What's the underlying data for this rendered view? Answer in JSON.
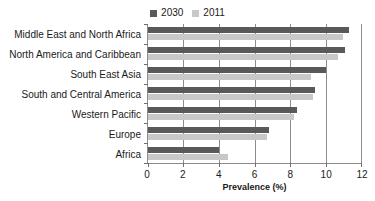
{
  "chart_data": {
    "type": "bar",
    "orientation": "horizontal",
    "title": "",
    "xlabel": "Prevalence (%)",
    "ylabel": "",
    "xlim": [
      0,
      12
    ],
    "xticks": [
      0,
      2,
      4,
      6,
      8,
      10,
      12
    ],
    "grid": true,
    "legend_position": "top-center",
    "categories": [
      "Middle East and North Africa",
      "North America and Caribbean",
      "South East Asia",
      "South and Central America",
      "Western Pacific",
      "Europe",
      "Africa"
    ],
    "series": [
      {
        "name": "2030",
        "color": "#595959",
        "values": [
          11.3,
          11.1,
          10.0,
          9.4,
          8.4,
          6.8,
          4.0
        ]
      },
      {
        "name": "2011",
        "color": "#c8c8c8",
        "values": [
          11.0,
          10.7,
          9.2,
          9.3,
          8.2,
          6.7,
          4.5
        ]
      }
    ]
  },
  "legend": {
    "entries": [
      {
        "label": "2030",
        "color": "#595959",
        "swatch_icon": "square-icon"
      },
      {
        "label": "2011",
        "color": "#c8c8c8",
        "swatch_icon": "square-icon"
      }
    ]
  },
  "axis": {
    "x_title": "Prevalence (%)",
    "x_tick_labels": [
      "0",
      "2",
      "4",
      "6",
      "8",
      "10",
      "12"
    ]
  },
  "colors": {
    "series_2030": "#595959",
    "series_2011": "#c8c8c8",
    "axis_line": "#8c8c8c",
    "text": "#1a1a1a",
    "background": "#ffffff"
  }
}
